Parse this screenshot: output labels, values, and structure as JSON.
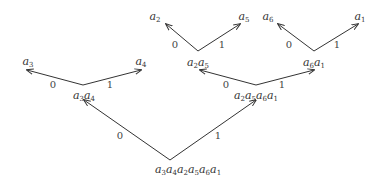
{
  "diagram": {
    "type": "binary-code-tree",
    "nodes": [
      {
        "id": "root",
        "label": "a3a4a2a5a6a1",
        "subs": [
          "3",
          "4",
          "2",
          "5",
          "6",
          "1"
        ],
        "x": 188,
        "y": 164
      },
      {
        "id": "n34",
        "label": "a3a4",
        "subs": [
          "3",
          "4"
        ],
        "x": 84,
        "y": 90
      },
      {
        "id": "n2561",
        "label": "a2a5a6a1",
        "subs": [
          "2",
          "5",
          "6",
          "1"
        ],
        "x": 256,
        "y": 90
      },
      {
        "id": "n25",
        "label": "a2a5",
        "subs": [
          "2",
          "5"
        ],
        "x": 198,
        "y": 57
      },
      {
        "id": "n61",
        "label": "a6a1",
        "subs": [
          "6",
          "1"
        ],
        "x": 314,
        "y": 57
      },
      {
        "id": "a3",
        "label": "a3",
        "subs": [
          "3"
        ],
        "x": 28,
        "y": 56
      },
      {
        "id": "a4",
        "label": "a4",
        "subs": [
          "4"
        ],
        "x": 141,
        "y": 56
      },
      {
        "id": "a2",
        "label": "a2",
        "subs": [
          "2"
        ],
        "x": 155,
        "y": 11
      },
      {
        "id": "a5",
        "label": "a5",
        "subs": [
          "5"
        ],
        "x": 244,
        "y": 11
      },
      {
        "id": "a6",
        "label": "a6",
        "subs": [
          "6"
        ],
        "x": 268,
        "y": 11
      },
      {
        "id": "a1",
        "label": "a1",
        "subs": [
          "1"
        ],
        "x": 360,
        "y": 11
      }
    ],
    "edges": [
      {
        "from": [
          170,
          160
        ],
        "to": [
          84,
          100
        ],
        "bit": "0",
        "bx": 120,
        "by": 131
      },
      {
        "from": [
          170,
          160
        ],
        "to": [
          256,
          100
        ],
        "bit": "1",
        "bx": 218,
        "by": 131
      },
      {
        "from": [
          83,
          85
        ],
        "to": [
          27,
          70
        ],
        "bit": "0",
        "bx": 53,
        "by": 80
      },
      {
        "from": [
          83,
          85
        ],
        "to": [
          141,
          70
        ],
        "bit": "1",
        "bx": 110,
        "by": 80
      },
      {
        "from": [
          256,
          85
        ],
        "to": [
          200,
          70
        ],
        "bit": "0",
        "bx": 226,
        "by": 80
      },
      {
        "from": [
          256,
          85
        ],
        "to": [
          314,
          70
        ],
        "bit": "1",
        "bx": 282,
        "by": 80
      },
      {
        "from": [
          198,
          51
        ],
        "to": [
          166,
          24
        ],
        "bit": "0",
        "bx": 175,
        "by": 40
      },
      {
        "from": [
          198,
          51
        ],
        "to": [
          240,
          24
        ],
        "bit": "1",
        "bx": 222,
        "by": 40
      },
      {
        "from": [
          314,
          51
        ],
        "to": [
          278,
          24
        ],
        "bit": "0",
        "bx": 289,
        "by": 40
      },
      {
        "from": [
          314,
          51
        ],
        "to": [
          358,
          24
        ],
        "bit": "1",
        "bx": 337,
        "by": 40
      }
    ],
    "colors": {
      "line": "#333333",
      "text": "#333333",
      "background": "#ffffff"
    }
  }
}
